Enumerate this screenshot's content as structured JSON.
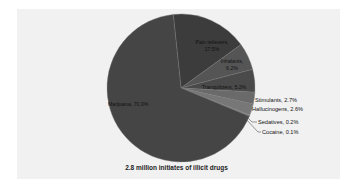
{
  "chart_data": {
    "type": "pie",
    "title": "2.8 million initiates of illicit drugs",
    "slices": [
      {
        "label": "Marijuana",
        "value": 70.3,
        "text": "Marijuana, 70.3%",
        "color": "#454545"
      },
      {
        "label": "Pain relievers",
        "value": 17.5,
        "text": "Pain relievers, 17.5%",
        "color": "#3c3c3c"
      },
      {
        "label": "Inhalants",
        "value": 6.2,
        "text": "Inhalants, 6.2%",
        "color": "#555555"
      },
      {
        "label": "Tranquilizers",
        "value": 5.2,
        "text": "Tranquilizers, 5.2%",
        "color": "#4a4a4a"
      },
      {
        "label": "Stimulants",
        "value": 2.7,
        "text": "Stimulants, 2.7%",
        "color": "#6a6a6a"
      },
      {
        "label": "Hallucinogens",
        "value": 2.6,
        "text": "Hallucinogens, 2.6%",
        "color": "#777777"
      },
      {
        "label": "Sedatives",
        "value": 0.2,
        "text": "Sedatives, 0.2%",
        "color": "#888888"
      },
      {
        "label": "Cocaine",
        "value": 0.1,
        "text": "Cocaine, 0.1%",
        "color": "#999999"
      }
    ],
    "legend": "none (data labels on slices)",
    "background": "#f1f1f1"
  },
  "labels": {
    "marijuana": "Marijuana, 70.3%",
    "pain_relievers_1": "Pain relievers,",
    "pain_relievers_2": "17.5%",
    "inhalants_1": "Inhalants,",
    "inhalants_2": "6.2%",
    "tranquilizers": "Tranquilizers, 5.2%",
    "stimulants": "Stimulants, 2.7%",
    "hallucinogens": "Hallucinogens, 2.6%",
    "sedatives": "Sedatives, 0.2%",
    "cocaine": "Cocaine, 0.1%"
  },
  "title": "2.8 million initiates of illicit drugs"
}
